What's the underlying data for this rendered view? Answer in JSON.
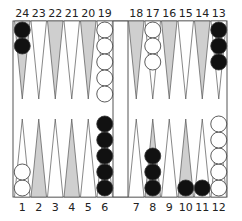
{
  "game": "backgammon",
  "colors": {
    "board_bg": "#ffffff",
    "shaded_point": "#cfcfcf",
    "plain_point": "#ffffff",
    "outline": "#555555",
    "black_checker": "#111111",
    "white_checker": "#ffffff"
  },
  "top_labels": [
    "24",
    "23",
    "22",
    "21",
    "20",
    "19",
    "18",
    "17",
    "16",
    "15",
    "14",
    "13"
  ],
  "bottom_labels": [
    "1",
    "2",
    "3",
    "4",
    "5",
    "6",
    "7",
    "8",
    "9",
    "10",
    "11",
    "12"
  ],
  "points": [
    {
      "point": 1,
      "color": "white",
      "count": 2
    },
    {
      "point": 2,
      "color": null,
      "count": 0
    },
    {
      "point": 3,
      "color": null,
      "count": 0
    },
    {
      "point": 4,
      "color": null,
      "count": 0
    },
    {
      "point": 5,
      "color": null,
      "count": 0
    },
    {
      "point": 6,
      "color": "black",
      "count": 5
    },
    {
      "point": 7,
      "color": null,
      "count": 0
    },
    {
      "point": 8,
      "color": "black",
      "count": 3
    },
    {
      "point": 9,
      "color": null,
      "count": 0
    },
    {
      "point": 10,
      "color": "black",
      "count": 1
    },
    {
      "point": 11,
      "color": "black",
      "count": 1
    },
    {
      "point": 12,
      "color": "white",
      "count": 5
    },
    {
      "point": 13,
      "color": "black",
      "count": 3
    },
    {
      "point": 14,
      "color": null,
      "count": 0
    },
    {
      "point": 15,
      "color": null,
      "count": 0
    },
    {
      "point": 16,
      "color": null,
      "count": 0
    },
    {
      "point": 17,
      "color": "white",
      "count": 3
    },
    {
      "point": 18,
      "color": null,
      "count": 0
    },
    {
      "point": 19,
      "color": "white",
      "count": 5
    },
    {
      "point": 20,
      "color": null,
      "count": 0
    },
    {
      "point": 21,
      "color": null,
      "count": 0
    },
    {
      "point": 22,
      "color": null,
      "count": 0
    },
    {
      "point": 23,
      "color": null,
      "count": 0
    },
    {
      "point": 24,
      "color": "black",
      "count": 2
    }
  ],
  "shaded_points": [
    2,
    4,
    8,
    10,
    14,
    16,
    18,
    20,
    22,
    24
  ]
}
